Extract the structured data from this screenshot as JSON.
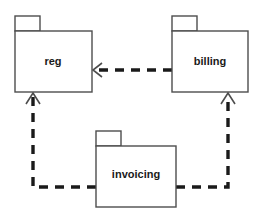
{
  "diagram": {
    "type": "uml-package-diagram",
    "width": 261,
    "height": 220,
    "background_color": "#ffffff",
    "line_color": "#1a1a1a",
    "border_color": "#4d4d4d",
    "text_color": "#1a1a1a",
    "packages": [
      {
        "id": "reg",
        "label": "reg",
        "tab": {
          "x": 15,
          "y": 16,
          "width": 25,
          "height": 15
        },
        "body": {
          "x": 15,
          "y": 31,
          "width": 77,
          "height": 61
        },
        "label_x": 53,
        "label_y": 62
      },
      {
        "id": "billing",
        "label": "billing",
        "tab": {
          "x": 172,
          "y": 16,
          "width": 25,
          "height": 15
        },
        "body": {
          "x": 172,
          "y": 31,
          "width": 76,
          "height": 61
        },
        "label_x": 210,
        "label_y": 62
      },
      {
        "id": "invoicing",
        "label": "invoicing",
        "tab": {
          "x": 96,
          "y": 131,
          "width": 25,
          "height": 15
        },
        "body": {
          "x": 96,
          "y": 146,
          "width": 80,
          "height": 61
        },
        "label_x": 136,
        "label_y": 175
      }
    ],
    "dependencies": [
      {
        "id": "billing-to-reg",
        "from": "billing",
        "to": "reg",
        "style": "dashed",
        "arrowhead": "open",
        "path": "M 172 70 L 95 70",
        "head_path": "M 102 63 L 93 70 L 102 77"
      },
      {
        "id": "invoicing-to-reg",
        "from": "invoicing",
        "to": "reg",
        "style": "dashed",
        "arrowhead": "open",
        "path": "M 96 187 L 33 187 L 33 95",
        "head_path": "M 26 104 L 33 93 L 40 104"
      },
      {
        "id": "invoicing-to-billing",
        "from": "invoicing",
        "to": "billing",
        "style": "dashed",
        "arrowhead": "open",
        "path": "M 176 187 L 228 187 L 228 95",
        "head_path": "M 221 104 L 228 93 L 235 104"
      }
    ]
  }
}
